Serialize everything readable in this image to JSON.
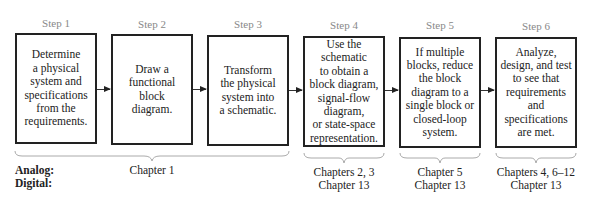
{
  "steps": [
    {
      "label": "Step 1",
      "text": "Determine\na physical\nsystem and\nspecifications\nfrom the\nrequirements."
    },
    {
      "label": "Step 2",
      "text": "Draw a\nfunctional\nblock\ndiagram."
    },
    {
      "label": "Step 3",
      "text": "Transform\nthe physical\nsystem into\na schematic."
    },
    {
      "label": "Step 4",
      "text": "Use the\nschematic\nto obtain a\nblock diagram,\nsignal-flow\ndiagram,\nor state-space\nrepresentation."
    },
    {
      "label": "Step 5",
      "text": "If multiple\nblocks, reduce\nthe block\ndiagram to a\nsingle block or\nclosed-loop\nsystem."
    },
    {
      "label": "Step 6",
      "text": "Analyze,\ndesign, and test\nto see that\nrequirements\nand\nspecifications\nare met."
    }
  ],
  "row_labels": {
    "analog": "Analog:",
    "digital": "Digital:"
  },
  "chapters": [
    {
      "group": "Steps 1-3",
      "text": "Chapter 1"
    },
    {
      "group": "Step 4",
      "text": "Chapters 2, 3\nChapter 13"
    },
    {
      "group": "Step 5",
      "text": "Chapter 5\nChapter 13"
    },
    {
      "group": "Step 6",
      "text": "Chapters 4, 6–12\nChapter 13"
    }
  ]
}
